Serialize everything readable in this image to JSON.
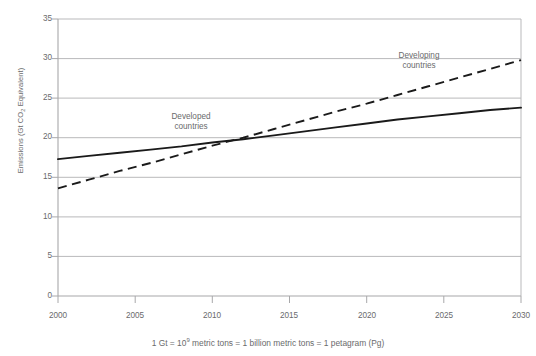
{
  "chart_data": {
    "type": "line",
    "title": "",
    "xlabel": "",
    "ylabel": "Emissions (Gt CO2 Equivalent)",
    "ylabel_prefix": "Emissions (Gt CO",
    "ylabel_sub": "2",
    "ylabel_suffix": " Equivalent)",
    "xlim": [
      2000,
      2030
    ],
    "ylim": [
      0,
      35
    ],
    "xticks": [
      2000,
      2005,
      2010,
      2015,
      2020,
      2025,
      2030
    ],
    "yticks": [
      0,
      5,
      10,
      15,
      20,
      25,
      30,
      35
    ],
    "grid": "horizontal",
    "legend_position": "inline-annotations",
    "series": [
      {
        "name": "Developed countries",
        "style": "solid",
        "color": "#1a1a1a",
        "x": [
          2000,
          2002,
          2004,
          2006,
          2008,
          2010,
          2012,
          2014,
          2016,
          2018,
          2020,
          2022,
          2024,
          2026,
          2028,
          2030
        ],
        "values": [
          17.3,
          17.7,
          18.1,
          18.5,
          18.9,
          19.4,
          19.8,
          20.3,
          20.8,
          21.3,
          21.8,
          22.3,
          22.7,
          23.1,
          23.5,
          23.8
        ]
      },
      {
        "name": "Developing countries",
        "style": "dashed",
        "color": "#1a1a1a",
        "x": [
          2000,
          2002,
          2004,
          2006,
          2008,
          2010,
          2012,
          2014,
          2016,
          2018,
          2020,
          2022,
          2024,
          2026,
          2028,
          2030
        ],
        "values": [
          13.6,
          14.7,
          15.8,
          16.8,
          17.9,
          19.0,
          20.0,
          21.1,
          22.2,
          23.3,
          24.3,
          25.4,
          26.5,
          27.6,
          28.7,
          29.8
        ]
      }
    ],
    "annotations": [
      {
        "text_line1": "Developed",
        "text_line2": "countries",
        "x": 2009.3,
        "y": 22.6
      },
      {
        "text_line1": "Developing",
        "text_line2": "countries",
        "x": 2024.2,
        "y": 30.9
      }
    ],
    "footnote": "1 Gt = 10⁹ metric tons = 1 billion metric tons = 1 petagram (Pg)",
    "footnote_prefix": "1 Gt = 10",
    "footnote_exponent": "9",
    "footnote_suffix": " metric tons = 1 billion metric tons = 1 petagram (Pg)",
    "colors": {
      "axis": "#a8a8aa",
      "grid": "#b9b9bb",
      "line": "#1a1a1a",
      "text": "#6a6a6c",
      "background": "#ffffff"
    }
  }
}
